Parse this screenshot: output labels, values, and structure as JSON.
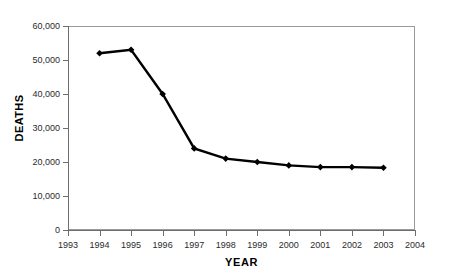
{
  "figure": {
    "title": "Figure 1. U.S. AIDS Deaths"
  },
  "chart_data": {
    "type": "line",
    "title": "",
    "xlabel": "YEAR",
    "ylabel": "DEATHS",
    "grid": false,
    "legend": "none",
    "marker": "diamond",
    "line_color": "#000000",
    "marker_color": "#000000",
    "xlim": [
      1993,
      2004
    ],
    "ylim": [
      0,
      60000
    ],
    "xticks": [
      1993,
      1994,
      1995,
      1996,
      1997,
      1998,
      1999,
      2000,
      2001,
      2002,
      2003,
      2004
    ],
    "xtick_labels": [
      "1993",
      "1994",
      "1995",
      "1996",
      "1997",
      "1998",
      "1999",
      "2000",
      "2001",
      "2002",
      "2003",
      "2004"
    ],
    "yticks": [
      0,
      10000,
      20000,
      30000,
      40000,
      50000,
      60000
    ],
    "ytick_labels": [
      "0",
      "10,000",
      "20,000",
      "30,000",
      "40,000",
      "50,000",
      "60,000"
    ],
    "x": [
      1994,
      1995,
      1996,
      1997,
      1998,
      1999,
      2000,
      2001,
      2002,
      2003
    ],
    "values": [
      52000,
      53000,
      40000,
      24000,
      21000,
      20000,
      19000,
      18500,
      18500,
      18300
    ]
  }
}
